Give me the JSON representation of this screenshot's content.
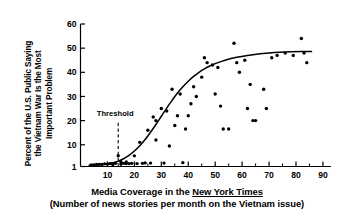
{
  "chart_data": {
    "type": "scatter",
    "title": "",
    "subtitle": "",
    "xlabel": "Media Coverage in the New York Times",
    "xlabel_line1_prefix": "Media Coverage in the ",
    "xlabel_line1_emphasis": "New York Times",
    "xlabel_line2": "(Number of news stories per month on the Vietnam issue)",
    "ylabel": "Percent of the U.S. Public Saying\nthe Vietnam War Is the Most\nImportant Problem",
    "xlim": [
      0,
      93
    ],
    "ylim": [
      1,
      60
    ],
    "grid": false,
    "legend": "none",
    "x_ticks_major": [
      10,
      20,
      30,
      40,
      50,
      60,
      70,
      80,
      90
    ],
    "x_tick_labels": [
      "10",
      "20",
      "30",
      "40",
      "50",
      "60",
      "70",
      "80",
      "90"
    ],
    "x_ticks_minor": [
      5,
      15,
      25,
      35,
      45,
      55,
      65,
      75,
      85
    ],
    "y_ticks_major": [
      1,
      10,
      20,
      30,
      40,
      50,
      60
    ],
    "y_tick_labels": [
      "1",
      "10",
      "20",
      "30",
      "40",
      "50",
      "60"
    ],
    "annotations": [
      {
        "label": "Threshold",
        "x": 14,
        "type": "vertical-dashed-line",
        "y_from": 1,
        "y_to": 20
      }
    ],
    "series": [
      {
        "name": "observations",
        "type": "scatter",
        "marker": "filled-circle",
        "color": "#000000",
        "points": [
          [
            4,
            1.6
          ],
          [
            5,
            1.6
          ],
          [
            6,
            1.8
          ],
          [
            7,
            1.9
          ],
          [
            8,
            1.8
          ],
          [
            9,
            2.1
          ],
          [
            10,
            2.0
          ],
          [
            11,
            2.2
          ],
          [
            12,
            1.8
          ],
          [
            13,
            2.3
          ],
          [
            14,
            5.5
          ],
          [
            15,
            3.0
          ],
          [
            15,
            2.0
          ],
          [
            16,
            2.3
          ],
          [
            17,
            2.2
          ],
          [
            17,
            2.9
          ],
          [
            18,
            2.2
          ],
          [
            19,
            2.3
          ],
          [
            20,
            5.4
          ],
          [
            21,
            2.2
          ],
          [
            22,
            11.0
          ],
          [
            23,
            2.3
          ],
          [
            24,
            2.5
          ],
          [
            25,
            16.0
          ],
          [
            26,
            2.4
          ],
          [
            27,
            21.5
          ],
          [
            28,
            20.0
          ],
          [
            28,
            12.0
          ],
          [
            30,
            25.0
          ],
          [
            31,
            2.4
          ],
          [
            32,
            24.0
          ],
          [
            33,
            9.5
          ],
          [
            34,
            33.0
          ],
          [
            35,
            18.0
          ],
          [
            36,
            22.0
          ],
          [
            37,
            31.0
          ],
          [
            38,
            2.6
          ],
          [
            39,
            16.5
          ],
          [
            40,
            22.0
          ],
          [
            41,
            27.0
          ],
          [
            42,
            34.0
          ],
          [
            43,
            30.0
          ],
          [
            45,
            38.0
          ],
          [
            46,
            46.0
          ],
          [
            47,
            44.0
          ],
          [
            49,
            43.0
          ],
          [
            50,
            31.0
          ],
          [
            51,
            42.0
          ],
          [
            52,
            26.0
          ],
          [
            53,
            16.5
          ],
          [
            55,
            16.5
          ],
          [
            57,
            52.0
          ],
          [
            58,
            44.0
          ],
          [
            59,
            40.0
          ],
          [
            61,
            45.0
          ],
          [
            62,
            25.0
          ],
          [
            63,
            35.0
          ],
          [
            64,
            20.0
          ],
          [
            65,
            20.0
          ],
          [
            68,
            33.0
          ],
          [
            69,
            25.0
          ],
          [
            71,
            46.0
          ],
          [
            73,
            47.0
          ],
          [
            76,
            48.0
          ],
          [
            79,
            47.0
          ],
          [
            82,
            54.0
          ],
          [
            83,
            48.0
          ],
          [
            84,
            44.0
          ]
        ]
      },
      {
        "name": "fitted-sigmoid-curve",
        "type": "line",
        "color": "#000000",
        "points": [
          [
            3,
            1.5
          ],
          [
            6,
            1.7
          ],
          [
            9,
            2.0
          ],
          [
            12,
            2.6
          ],
          [
            14,
            3.2
          ],
          [
            16,
            4.2
          ],
          [
            18,
            5.6
          ],
          [
            20,
            7.4
          ],
          [
            22,
            9.6
          ],
          [
            24,
            12.2
          ],
          [
            26,
            15.2
          ],
          [
            28,
            18.4
          ],
          [
            30,
            21.8
          ],
          [
            32,
            25.2
          ],
          [
            34,
            28.4
          ],
          [
            36,
            31.4
          ],
          [
            38,
            34.0
          ],
          [
            40,
            36.3
          ],
          [
            42,
            38.3
          ],
          [
            44,
            40.0
          ],
          [
            46,
            41.4
          ],
          [
            48,
            42.6
          ],
          [
            50,
            43.6
          ],
          [
            54,
            45.1
          ],
          [
            58,
            46.2
          ],
          [
            62,
            47.0
          ],
          [
            66,
            47.6
          ],
          [
            70,
            48.0
          ],
          [
            74,
            48.3
          ],
          [
            78,
            48.5
          ],
          [
            82,
            48.6
          ],
          [
            86,
            48.6
          ]
        ]
      }
    ]
  },
  "axes": {
    "x_axis_name": "media-coverage-axis",
    "y_axis_name": "percent-public-axis"
  }
}
